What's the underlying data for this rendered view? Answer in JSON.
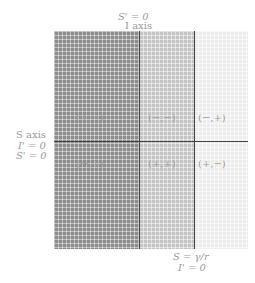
{
  "top_labels": {
    "line1": "S' = 0",
    "line2": "I axis"
  },
  "left_labels": {
    "line1": "S axis",
    "line2": "I' = 0",
    "line3": "S' = 0"
  },
  "bottom_labels": {
    "line1": "S = γ/r",
    "line2": "I' = 0"
  },
  "regions": {
    "upper_left": "(+,−)",
    "upper_mid": "(−,−)",
    "upper_right": "(−,+)",
    "lower_left": "(−,+)",
    "lower_mid": "(+,+)",
    "lower_right": "(+,−)"
  },
  "colors": {
    "dark": "#8c8c8c",
    "mid": "#c4c4c4",
    "light": "#ececec",
    "axis": "#444444"
  }
}
